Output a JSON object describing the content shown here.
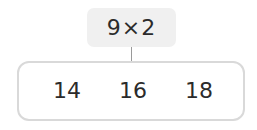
{
  "question": {
    "expression": "9×2"
  },
  "options": [
    {
      "label": "14"
    },
    {
      "label": "16"
    },
    {
      "label": "18"
    }
  ],
  "colors": {
    "question_bg": "#f0f0f0",
    "border": "#d9d9d9",
    "connector": "#9a9a9a",
    "text": "#2b2b2b"
  }
}
